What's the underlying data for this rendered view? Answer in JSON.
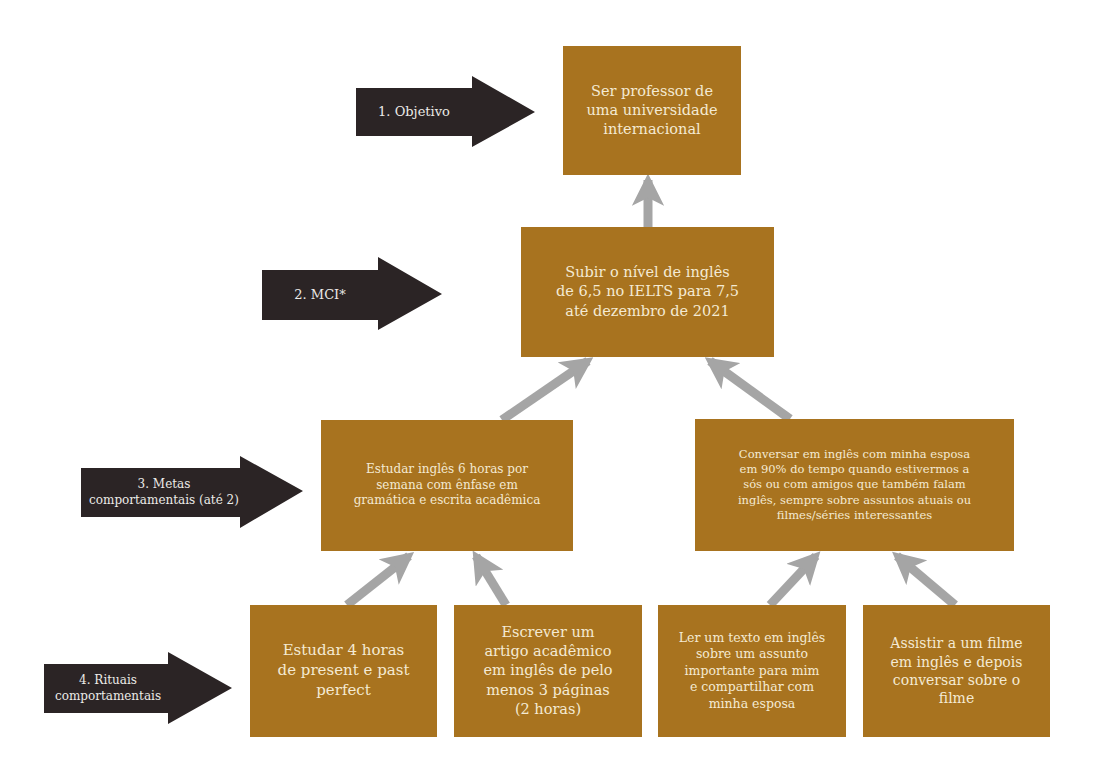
{
  "colors": {
    "box_fill": "#a8731f",
    "box_text": "#f4ead3",
    "level_arrow": "#2b2425",
    "connector_arrow": "#a5a5a5",
    "background": "#ffffff"
  },
  "levels": [
    {
      "id": "objetivo",
      "label": "1. Objetivo"
    },
    {
      "id": "mci",
      "label": "2. MCI*"
    },
    {
      "id": "metas",
      "label": "3. Metas\ncomportamentais (até 2)"
    },
    {
      "id": "rituais",
      "label": "4. Rituais\ncomportamentais"
    }
  ],
  "objective": {
    "text": "Ser professor de\numa universidade\ninternacional"
  },
  "mci": {
    "text": "Subir o nível de inglês\nde 6,5 no IELTS para 7,5\naté dezembro de 2021"
  },
  "goals": [
    {
      "text": "Estudar inglês 6 horas por\nsemana com ênfase em\ngramática e escrita acadêmica"
    },
    {
      "text": "Conversar em inglês com minha esposa\nem 90% do tempo quando estivermos a\nsós ou com amigos que também falam\ninglês, sempre sobre assuntos atuais ou\nfilmes/séries interessantes"
    }
  ],
  "rituals": [
    {
      "text": "Estudar 4 horas\nde present e past\nperfect"
    },
    {
      "text": "Escrever um\nartigo acadêmico\nem inglês de pelo\nmenos 3 páginas\n(2 horas)"
    },
    {
      "text": "Ler um texto em inglês\nsobre um assunto\nimportante para mim\ne compartilhar com\nminha esposa"
    },
    {
      "text": "Assistir a um filme\nem inglês e depois\nconversar sobre o\nfilme"
    }
  ]
}
